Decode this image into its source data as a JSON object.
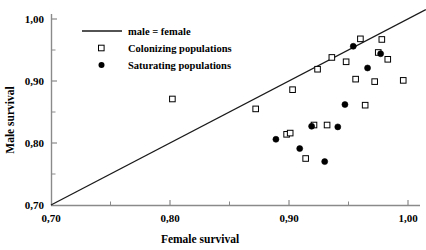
{
  "chart_data": {
    "type": "scatter",
    "title": "",
    "xlabel": "Female survival",
    "ylabel": "Male survival",
    "xlim": [
      0.7,
      1.0
    ],
    "ylim": [
      0.7,
      1.0
    ],
    "xticks": [
      "0,70",
      "0,80",
      "0,90",
      "1,00"
    ],
    "xtick_values": [
      0.7,
      0.8,
      0.9,
      1.0
    ],
    "yticks": [
      "0,70",
      "0,80",
      "0,90",
      "1,00"
    ],
    "ytick_values": [
      0.7,
      0.8,
      0.9,
      1.0
    ],
    "minor_xticks": [
      0.75,
      0.85,
      0.95
    ],
    "minor_yticks": [
      0.75,
      0.85,
      0.95
    ],
    "grid": false,
    "legend_position": "top-left",
    "legend": [
      {
        "label": "male = female",
        "marker": "line"
      },
      {
        "label": "Colonizing populations",
        "marker": "open-square"
      },
      {
        "label": "Saturating populations",
        "marker": "filled-circle"
      }
    ],
    "reference_line": {
      "label": "male = female",
      "from": [
        0.7,
        0.7
      ],
      "to": [
        1.015,
        1.015
      ],
      "color": "#1a1a1a"
    },
    "series": [
      {
        "name": "Colonizing populations",
        "marker": "open-square",
        "color": "#000000",
        "points": [
          [
            0.802,
            0.871
          ],
          [
            0.872,
            0.855
          ],
          [
            0.898,
            0.814
          ],
          [
            0.901,
            0.816
          ],
          [
            0.903,
            0.886
          ],
          [
            0.914,
            0.775
          ],
          [
            0.921,
            0.829
          ],
          [
            0.924,
            0.919
          ],
          [
            0.932,
            0.829
          ],
          [
            0.936,
            0.938
          ],
          [
            0.948,
            0.931
          ],
          [
            0.956,
            0.903
          ],
          [
            0.96,
            0.968
          ],
          [
            0.964,
            0.861
          ],
          [
            0.972,
            0.899
          ],
          [
            0.975,
            0.946
          ],
          [
            0.978,
            0.967
          ],
          [
            0.983,
            0.935
          ],
          [
            0.996,
            0.901
          ]
        ]
      },
      {
        "name": "Saturating populations",
        "marker": "filled-circle",
        "color": "#000000",
        "points": [
          [
            0.889,
            0.806
          ],
          [
            0.909,
            0.791
          ],
          [
            0.919,
            0.827
          ],
          [
            0.93,
            0.77
          ],
          [
            0.941,
            0.826
          ],
          [
            0.947,
            0.862
          ],
          [
            0.954,
            0.956
          ],
          [
            0.966,
            0.921
          ],
          [
            0.977,
            0.944
          ]
        ]
      }
    ]
  },
  "axes": {
    "x_label": "Female survival",
    "y_label": "Male survival"
  }
}
